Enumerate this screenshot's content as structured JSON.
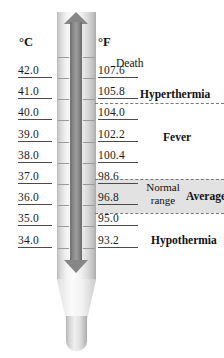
{
  "diagram": {
    "background_color": "#ffffff"
  },
  "units": {
    "celsius_header": "°C",
    "fahrenheit_header": "°F"
  },
  "chart_data": {
    "type": "table",
    "xlabel": "",
    "ylabel": "Temperature",
    "celsius_label": "°C",
    "fahrenheit_label": "°F",
    "celsius": [
      "42.0",
      "41.0",
      "40.0",
      "39.0",
      "38.0",
      "37.0",
      "36.0",
      "35.0",
      "34.0"
    ],
    "fahrenheit": [
      "107.6",
      "105.8",
      "104.0",
      "102.2",
      "100.4",
      "98.6",
      "96.8",
      "95.0",
      "93.2"
    ],
    "zones": [
      {
        "label": "Death",
        "bold": false
      },
      {
        "label": "Hyperthermia",
        "bold": true
      },
      {
        "label": "Fever",
        "bold": true
      },
      {
        "label": "Average",
        "bold": true
      },
      {
        "label": "Hypothermia",
        "bold": true
      }
    ],
    "normal_range": {
      "caption_line1": "Normal",
      "caption_line2": "range",
      "celsius_min": "36.0",
      "celsius_max": "37.0",
      "fahrenheit_min": "96.8",
      "fahrenheit_max": "98.6",
      "band_color": "#e2e2e2"
    }
  },
  "scale": {
    "celsius": [
      {
        "value": "42.0"
      },
      {
        "value": "41.0"
      },
      {
        "value": "40.0"
      },
      {
        "value": "39.0"
      },
      {
        "value": "38.0"
      },
      {
        "value": "37.0"
      },
      {
        "value": "36.0"
      },
      {
        "value": "35.0"
      },
      {
        "value": "34.0"
      }
    ],
    "fahrenheit": [
      {
        "value": "107.6"
      },
      {
        "value": "105.8"
      },
      {
        "value": "104.0"
      },
      {
        "value": "102.2"
      },
      {
        "value": "100.4"
      },
      {
        "value": "98.6"
      },
      {
        "value": "96.8"
      },
      {
        "value": "95.0"
      },
      {
        "value": "93.2"
      }
    ]
  },
  "annotations": {
    "death": "Death",
    "hyperthermia": "Hyperthermia",
    "fever": "Fever",
    "average": "Average",
    "hypothermia": "Hypothermia",
    "normal_line1": "Normal",
    "normal_line2": "range"
  },
  "colors": {
    "mercury": "#868686",
    "band": "#e2e2e2",
    "text": "#111111",
    "rule": "#4a4a4a",
    "dashed": "#7a7a7a"
  }
}
